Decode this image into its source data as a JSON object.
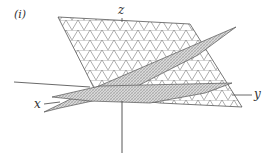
{
  "figure": {
    "panel_label": "(i)",
    "axes": {
      "x": "x",
      "y": "y",
      "z": "z"
    },
    "planes": [
      {
        "name": "large-triangular-mesh-plane",
        "style": "triangular grid"
      },
      {
        "name": "steep-shaded-plane",
        "style": "fine hatched"
      },
      {
        "name": "flat-shaded-plane",
        "style": "fine hatched"
      }
    ]
  }
}
